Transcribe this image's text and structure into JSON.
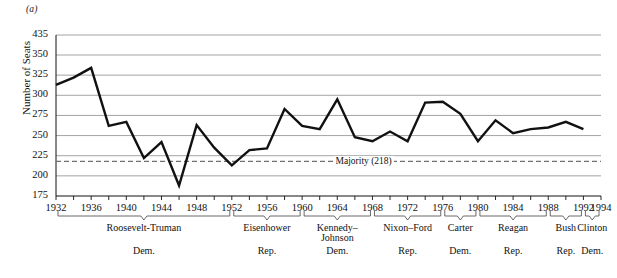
{
  "panel": {
    "label": "(a)"
  },
  "chart_data": {
    "type": "line",
    "title": "",
    "subtitle": "",
    "xlabel": "",
    "ylabel": "Number of Seats",
    "xlim": [
      1932,
      1994
    ],
    "ylim": [
      175,
      350
    ],
    "y_axis_break_top_value": 435,
    "grid": true,
    "grid_axis": "y",
    "legend": "none",
    "x_tick_step": 2,
    "x_tick_labels": [
      "1932",
      "1936",
      "1940",
      "1944",
      "1948",
      "1952",
      "1956",
      "1960",
      "1964",
      "1968",
      "1972",
      "1976",
      "1980",
      "1984",
      "1988",
      "1992",
      "1994"
    ],
    "x_tick_label_step": 4,
    "y_tick_labels": [
      "435",
      "350",
      "325",
      "300",
      "275",
      "250",
      "225",
      "200",
      "175"
    ],
    "y_tick_values": [
      435,
      350,
      325,
      300,
      275,
      250,
      225,
      200,
      175
    ],
    "series": [
      {
        "name": "Democratic Seats in the House",
        "x": [
          1932,
          1934,
          1936,
          1938,
          1940,
          1942,
          1944,
          1946,
          1948,
          1950,
          1952,
          1954,
          1956,
          1958,
          1960,
          1962,
          1964,
          1966,
          1968,
          1970,
          1972,
          1974,
          1976,
          1978,
          1980,
          1982,
          1984,
          1986,
          1988,
          1990,
          1992
        ],
        "values": [
          313,
          322,
          334,
          262,
          267,
          222,
          242,
          188,
          263,
          235,
          213,
          232,
          234,
          283,
          262,
          258,
          295,
          248,
          243,
          255,
          243,
          291,
          292,
          277,
          243,
          269,
          253,
          258,
          260,
          267,
          258
        ]
      }
    ],
    "reference_line": {
      "label": "Majority (218)",
      "value": 218,
      "style": "dashed"
    },
    "annotations": {
      "eras": [
        {
          "name": "Roosevelt-Truman",
          "party": "Dem.",
          "start": 1932,
          "end": 1952
        },
        {
          "name": "Eisenhower",
          "party": "Rep.",
          "start": 1952,
          "end": 1960
        },
        {
          "name": "Kennedy–\nJohnson",
          "party": "Dem.",
          "start": 1960,
          "end": 1968
        },
        {
          "name": "Nixon–Ford",
          "party": "Rep.",
          "start": 1968,
          "end": 1976
        },
        {
          "name": "Carter",
          "party": "Dem.",
          "start": 1976,
          "end": 1980
        },
        {
          "name": "Reagan",
          "party": "Rep.",
          "start": 1980,
          "end": 1988
        },
        {
          "name": "Bush",
          "party": "Rep.",
          "start": 1988,
          "end": 1992
        },
        {
          "name": "Clinton",
          "party": "Dem.",
          "start": 1992,
          "end": 1994
        }
      ]
    },
    "colors": {
      "line": "#111111",
      "grid": "#9a9a9a",
      "axis": "#111111",
      "text": "#111111",
      "background": "#ffffff"
    }
  }
}
